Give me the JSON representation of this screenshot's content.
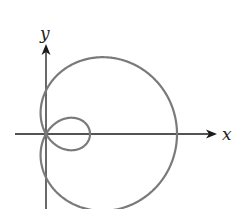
{
  "figure": {
    "type": "polar-curve",
    "curve_name": "limacon-with-inner-loop",
    "axes": {
      "x_label": "x",
      "y_label": "y"
    },
    "geometry": {
      "origin": [
        46,
        134
      ],
      "x_axis": {
        "start": 15,
        "end": 217
      },
      "y_axis": {
        "bottom": 209,
        "top": 44
      },
      "limacon": {
        "a": 43.5,
        "b": 87.5,
        "orientation": "cos"
      }
    },
    "colors": {
      "axis": "#1a1a1a",
      "curve": "#7a7a7a",
      "background": "#ffffff"
    }
  }
}
